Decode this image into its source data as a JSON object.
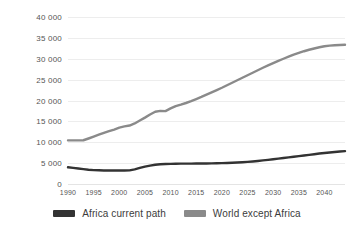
{
  "chart_data": {
    "type": "line",
    "title": "",
    "xlabel": "",
    "ylabel": "Average income in 2018 US$",
    "xlim": [
      1990,
      2044
    ],
    "ylim": [
      0,
      40000
    ],
    "grid": true,
    "legend_position": "bottom",
    "ytick_labels": [
      "40 000",
      "35 000",
      "30 000",
      "25 000",
      "20 000",
      "15 000",
      "10 000",
      "5 000",
      "0"
    ],
    "ytick_values": [
      40000,
      35000,
      30000,
      25000,
      20000,
      15000,
      10000,
      5000,
      0
    ],
    "xtick_labels": [
      "1990",
      "1995",
      "2000",
      "2005",
      "2010",
      "2015",
      "2020",
      "2025",
      "2030",
      "2035",
      "2040"
    ],
    "xtick_values": [
      1990,
      1995,
      2000,
      2005,
      2010,
      2015,
      2020,
      2025,
      2030,
      2035,
      2040
    ],
    "x": [
      1990,
      1991,
      1992,
      1993,
      1994,
      1995,
      1996,
      1997,
      1998,
      1999,
      2000,
      2001,
      2002,
      2003,
      2004,
      2005,
      2006,
      2007,
      2008,
      2009,
      2010,
      2011,
      2012,
      2013,
      2014,
      2015,
      2016,
      2017,
      2018,
      2019,
      2020,
      2021,
      2022,
      2023,
      2024,
      2025,
      2026,
      2027,
      2028,
      2029,
      2030,
      2031,
      2032,
      2033,
      2034,
      2035,
      2036,
      2037,
      2038,
      2039,
      2040,
      2041,
      2042,
      2043,
      2044
    ],
    "series": [
      {
        "name": "Africa current path",
        "color": "#333333",
        "values": [
          4000,
          3850,
          3700,
          3550,
          3420,
          3320,
          3280,
          3250,
          3230,
          3220,
          3230,
          3250,
          3260,
          3500,
          3850,
          4150,
          4400,
          4600,
          4720,
          4780,
          4820,
          4850,
          4870,
          4880,
          4890,
          4900,
          4910,
          4920,
          4940,
          4960,
          4990,
          5030,
          5080,
          5140,
          5210,
          5300,
          5400,
          5520,
          5650,
          5790,
          5940,
          6090,
          6240,
          6390,
          6540,
          6690,
          6840,
          6990,
          7140,
          7290,
          7430,
          7560,
          7680,
          7780,
          7870
        ]
      },
      {
        "name": "World except Africa",
        "color": "#8a8a8a",
        "values": [
          10450,
          10450,
          10450,
          10480,
          10900,
          11350,
          11800,
          12250,
          12650,
          13050,
          13500,
          13800,
          14000,
          14500,
          15200,
          15900,
          16650,
          17300,
          17500,
          17450,
          18100,
          18650,
          19000,
          19400,
          19850,
          20350,
          20850,
          21400,
          21950,
          22500,
          23050,
          23650,
          24250,
          24850,
          25450,
          26050,
          26650,
          27250,
          27850,
          28400,
          28950,
          29500,
          30000,
          30500,
          31000,
          31400,
          31800,
          32150,
          32450,
          32750,
          33000,
          33150,
          33250,
          33300,
          33350
        ]
      }
    ]
  },
  "legend": {
    "items": [
      {
        "label": "Africa current path",
        "color": "#333333"
      },
      {
        "label": "World except Africa",
        "color": "#8a8a8a"
      }
    ]
  }
}
